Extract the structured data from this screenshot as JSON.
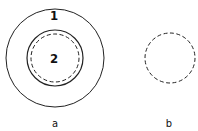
{
  "diagram": {
    "colors": {
      "stroke": "#222222",
      "background": "#ffffff"
    },
    "figure_a": {
      "caption": "a",
      "outer_circle": {
        "label": "1",
        "cx": 55,
        "cy": 58,
        "r": 49,
        "style": "solid"
      },
      "inner_circle": {
        "label": "2",
        "cx": 55,
        "cy": 58,
        "r": 28,
        "style": "solid"
      },
      "inner_dashed_circle": {
        "cx": 55,
        "cy": 58,
        "r": 24,
        "style": "dashed"
      }
    },
    "figure_b": {
      "caption": "b",
      "dashed_circle": {
        "cx": 170,
        "cy": 58,
        "r": 25,
        "style": "dashed"
      }
    }
  }
}
